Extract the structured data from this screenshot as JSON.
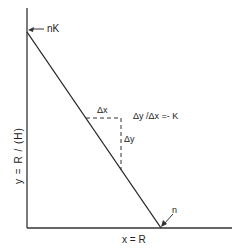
{
  "diagram": {
    "y_axis_label": "y = R / (H)",
    "x_axis_label": "x = R",
    "intercept_label_top": "nK",
    "intercept_label_bottom": "n",
    "delta_x_label": "Δx",
    "delta_y_label": "Δy",
    "slope_label": "Δy /Δx =- K",
    "colors": {
      "line": "#222222",
      "background": "#ffffff"
    }
  }
}
